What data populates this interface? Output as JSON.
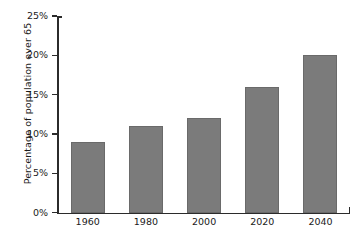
{
  "chart_data": {
    "type": "bar",
    "title": "",
    "xlabel": "",
    "ylabel": "Percentage of population over 65",
    "categories": [
      "1960",
      "1980",
      "2000",
      "2020",
      "2040"
    ],
    "values": [
      9,
      11,
      12,
      16,
      20
    ],
    "value_unit": "%",
    "ylim": [
      0,
      25
    ],
    "ytick_values": [
      0,
      5,
      10,
      15,
      20,
      25
    ],
    "ytick_labels": [
      "0%",
      "5%",
      "10%",
      "15%",
      "20%",
      "25%"
    ],
    "grid": false,
    "legend": null,
    "series": [
      {
        "name": "Percentage of population over 65",
        "values": [
          9,
          11,
          12,
          16,
          20
        ]
      }
    ],
    "colors": {
      "bar_fill": "#7b7b7b",
      "bar_edge": "#6a6a6a",
      "axis": "#2b2b2b",
      "text": "#1a1a1a",
      "background": "#ffffff"
    }
  }
}
